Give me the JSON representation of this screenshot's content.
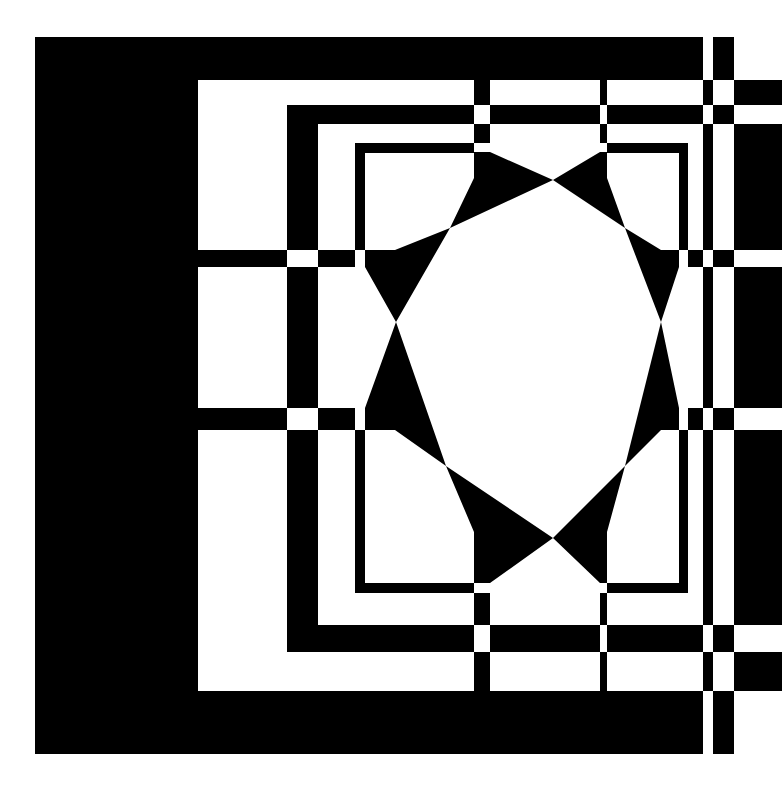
{
  "artwork": {
    "title": "Geometric op-art composition",
    "canvas": {
      "width": 782,
      "height": 789
    },
    "colors": {
      "background": "#ffffff",
      "ink": "#000000"
    },
    "black_rects": [
      {
        "name": "outer-frame-top",
        "x": 35,
        "y": 37,
        "w": 668,
        "h": 43
      },
      {
        "name": "outer-frame-left",
        "x": 35,
        "y": 37,
        "w": 163,
        "h": 717
      },
      {
        "name": "outer-frame-bottom",
        "x": 35,
        "y": 691,
        "w": 668,
        "h": 63
      },
      {
        "name": "right-strip-top-a",
        "x": 713,
        "y": 37,
        "w": 21,
        "h": 43
      },
      {
        "name": "right-strip-bottom-a",
        "x": 713,
        "y": 691,
        "w": 21,
        "h": 63
      },
      {
        "name": "band-h-106",
        "x": 198,
        "y": 106,
        "w": 0,
        "h": 0
      },
      {
        "name": "sq-frame2-top",
        "x": 287,
        "y": 105,
        "w": 187,
        "h": 19
      },
      {
        "name": "sq-frame2-top-b",
        "x": 490,
        "y": 105,
        "w": 110,
        "h": 19
      },
      {
        "name": "sq-frame2-top-c",
        "x": 607,
        "y": 105,
        "w": 96,
        "h": 19
      },
      {
        "name": "sq-frame2-left-a",
        "x": 287,
        "y": 105,
        "w": 31,
        "h": 145
      },
      {
        "name": "sq-frame2-left-b",
        "x": 287,
        "y": 267,
        "w": 31,
        "h": 141
      },
      {
        "name": "sq-frame2-left-c",
        "x": 287,
        "y": 430,
        "w": 31,
        "h": 222
      },
      {
        "name": "sq-frame2-bottom-a",
        "x": 287,
        "y": 625,
        "w": 187,
        "h": 27
      },
      {
        "name": "sq-frame2-bottom-b",
        "x": 490,
        "y": 625,
        "w": 110,
        "h": 27
      },
      {
        "name": "sq-frame2-bottom-c",
        "x": 607,
        "y": 625,
        "w": 96,
        "h": 27
      },
      {
        "name": "sq-frame3-top-a",
        "x": 355,
        "y": 143,
        "w": 119,
        "h": 10
      },
      {
        "name": "sq-frame3-top-b",
        "x": 607,
        "y": 143,
        "w": 81,
        "h": 10
      },
      {
        "name": "sq-frame3-left-a",
        "x": 355,
        "y": 143,
        "w": 10,
        "h": 107
      },
      {
        "name": "sq-frame3-left-b",
        "x": 355,
        "y": 430,
        "w": 10,
        "h": 163
      },
      {
        "name": "sq-frame3-bottom-a",
        "x": 355,
        "y": 583,
        "w": 119,
        "h": 10
      },
      {
        "name": "sq-frame3-bottom-b",
        "x": 607,
        "y": 583,
        "w": 81,
        "h": 10
      },
      {
        "name": "sq-frame3-right-a",
        "x": 679,
        "y": 143,
        "w": 9,
        "h": 107
      },
      {
        "name": "sq-frame3-right-b",
        "x": 679,
        "y": 430,
        "w": 9,
        "h": 163
      },
      {
        "name": "h-band-250-a",
        "x": 198,
        "y": 250,
        "w": 89,
        "h": 17
      },
      {
        "name": "h-band-250-b",
        "x": 318,
        "y": 250,
        "w": 37,
        "h": 17
      },
      {
        "name": "h-band-250-c",
        "x": 688,
        "y": 250,
        "w": 15,
        "h": 17
      },
      {
        "name": "h-band-250-d",
        "x": 713,
        "y": 250,
        "w": 21,
        "h": 17
      },
      {
        "name": "h-band-408-a",
        "x": 198,
        "y": 408,
        "w": 89,
        "h": 22
      },
      {
        "name": "h-band-408-b",
        "x": 318,
        "y": 408,
        "w": 37,
        "h": 22
      },
      {
        "name": "h-band-408-c",
        "x": 688,
        "y": 408,
        "w": 15,
        "h": 22
      },
      {
        "name": "h-band-408-d",
        "x": 713,
        "y": 408,
        "w": 21,
        "h": 22
      },
      {
        "name": "v-bar-474-top",
        "x": 474,
        "y": 80,
        "w": 16,
        "h": 25
      },
      {
        "name": "v-bar-474-mid",
        "x": 474,
        "y": 124,
        "w": 16,
        "h": 19
      },
      {
        "name": "v-bar-474-bot",
        "x": 474,
        "y": 593,
        "w": 16,
        "h": 32
      },
      {
        "name": "v-bar-474-bot2",
        "x": 474,
        "y": 652,
        "w": 16,
        "h": 39
      },
      {
        "name": "v-bar-600-top",
        "x": 600,
        "y": 80,
        "w": 7,
        "h": 25
      },
      {
        "name": "v-bar-600-mid",
        "x": 600,
        "y": 124,
        "w": 7,
        "h": 19
      },
      {
        "name": "v-bar-600-bot",
        "x": 600,
        "y": 593,
        "w": 7,
        "h": 32
      },
      {
        "name": "v-bar-600-bot2",
        "x": 600,
        "y": 652,
        "w": 7,
        "h": 39
      },
      {
        "name": "v-bar-703-a",
        "x": 703,
        "y": 80,
        "w": 10,
        "h": 25
      },
      {
        "name": "v-bar-703-b",
        "x": 703,
        "y": 124,
        "w": 10,
        "h": 126
      },
      {
        "name": "v-bar-703-c",
        "x": 703,
        "y": 267,
        "w": 10,
        "h": 141
      },
      {
        "name": "v-bar-703-d",
        "x": 703,
        "y": 430,
        "w": 10,
        "h": 195
      },
      {
        "name": "v-bar-703-e",
        "x": 703,
        "y": 652,
        "w": 10,
        "h": 39
      },
      {
        "name": "right-block-a",
        "x": 734,
        "y": 80,
        "w": 48,
        "h": 25
      },
      {
        "name": "right-block-b",
        "x": 734,
        "y": 124,
        "w": 48,
        "h": 126
      },
      {
        "name": "right-block-c",
        "x": 734,
        "y": 267,
        "w": 48,
        "h": 141
      },
      {
        "name": "right-block-d",
        "x": 734,
        "y": 430,
        "w": 48,
        "h": 195
      },
      {
        "name": "right-block-e",
        "x": 734,
        "y": 652,
        "w": 48,
        "h": 39
      },
      {
        "name": "right-check-a",
        "x": 713,
        "y": 105,
        "w": 21,
        "h": 19
      },
      {
        "name": "right-check-b",
        "x": 713,
        "y": 625,
        "w": 21,
        "h": 27
      }
    ],
    "black_polygons": [
      {
        "name": "triangle-top-left",
        "points": "474,152 490,152 553,180 450,228 474,178"
      },
      {
        "name": "triangle-top-right",
        "points": "553,180 600,152 607,152 607,178 625,228"
      },
      {
        "name": "triangle-upper-left",
        "points": "365,250 395,250 450,228 396,322 365,267"
      },
      {
        "name": "triangle-upper-right",
        "points": "625,228 661,250 679,250 679,267 661,322"
      },
      {
        "name": "triangle-lower-left",
        "points": "396,322 446,466 395,430 365,430 365,408"
      },
      {
        "name": "triangle-lower-right",
        "points": "661,322 679,408 679,430 661,430 625,466"
      },
      {
        "name": "triangle-bottom-left",
        "points": "446,466 553,538 490,583 474,583 474,532"
      },
      {
        "name": "triangle-bottom-right",
        "points": "625,466 607,532 607,583 600,583 553,538"
      }
    ]
  }
}
